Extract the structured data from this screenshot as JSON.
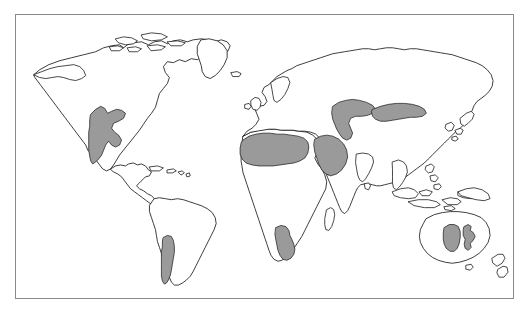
{
  "figure": {
    "type": "world-map",
    "title": "",
    "caption": "",
    "frame": {
      "x": 15,
      "y": 14,
      "width": 499,
      "height": 285,
      "border_color": "#8a8a8a",
      "background_color": "#ffffff"
    },
    "projection": "equirectangular",
    "style": {
      "coastline_color": "#1a1a1a",
      "land_fill": "#ffffff",
      "highlight_fill": "#9a9a9a",
      "highlight_stroke": "#2a2a2a"
    },
    "legend": {
      "visible": false,
      "entries": [
        {
          "label": "Arid / desert region",
          "swatch": "#9a9a9a"
        }
      ]
    }
  },
  "map_data": {
    "theme": "Global distribution of arid and desert regions",
    "landmasses": [
      {
        "name": "north-america",
        "label": "North America"
      },
      {
        "name": "greenland",
        "label": "Greenland"
      },
      {
        "name": "south-america",
        "label": "South America"
      },
      {
        "name": "africa",
        "label": "Africa"
      },
      {
        "name": "eurasia",
        "label": "Eurasia"
      },
      {
        "name": "australia",
        "label": "Australia"
      },
      {
        "name": "new-zealand",
        "label": "New Zealand"
      },
      {
        "name": "madagascar",
        "label": "Madagascar"
      },
      {
        "name": "japan",
        "label": "Japan"
      },
      {
        "name": "british-isles",
        "label": "British Isles"
      },
      {
        "name": "indonesia",
        "label": "Indonesia"
      },
      {
        "name": "philippines",
        "label": "Philippines"
      },
      {
        "name": "iceland",
        "label": "Iceland"
      },
      {
        "name": "caribbean",
        "label": "Caribbean Islands"
      },
      {
        "name": "sri-lanka",
        "label": "Sri Lanka"
      },
      {
        "name": "canadian-arctic",
        "label": "Canadian Arctic Archipelago"
      }
    ],
    "highlighted_regions": [
      {
        "name": "north-american-desert",
        "label": "Southwestern North America",
        "continent": "North America"
      },
      {
        "name": "atacama-patagonia-desert",
        "label": "Atacama and Patagonian arid belt",
        "continent": "South America"
      },
      {
        "name": "sahara-desert",
        "label": "Sahara",
        "continent": "Africa"
      },
      {
        "name": "arabian-desert",
        "label": "Arabian Peninsula",
        "continent": "Asia"
      },
      {
        "name": "namib-kalahari-desert",
        "label": "Namib and Kalahari",
        "continent": "Africa"
      },
      {
        "name": "central-asian-desert",
        "label": "Central Asian deserts",
        "continent": "Asia"
      },
      {
        "name": "gobi-desert",
        "label": "Gobi and Taklamakan",
        "continent": "Asia"
      },
      {
        "name": "australian-western-desert",
        "label": "Great Sandy / Gibson Desert",
        "continent": "Australia"
      },
      {
        "name": "australian-central-desert",
        "label": "Simpson Desert",
        "continent": "Australia"
      }
    ]
  }
}
